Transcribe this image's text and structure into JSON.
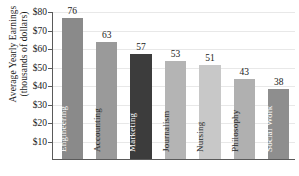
{
  "chart_data": {
    "type": "bar",
    "title": "",
    "xlabel": "",
    "ylabel": "Average Yearly Earnings (thousands of dollars)",
    "ylabel_line1": "Average Yearly Earnings",
    "ylabel_line2": "(thousands of dollars)",
    "categories": [
      "Engineering",
      "Accounting",
      "Marketing",
      "Journalism",
      "Nursing",
      "Philosophy",
      "Social Work"
    ],
    "values": [
      76,
      63,
      57,
      53,
      51,
      43,
      38
    ],
    "bar_colors": [
      "#8a8a8a",
      "#9a9a9a",
      "#3c3c3c",
      "#b4b4b4",
      "#c8c8c8",
      "#b0b0b0",
      "#8e8e8e"
    ],
    "bar_label_colors": [
      "#ffffff",
      "#2a2a2a",
      "#ffffff",
      "#2a2a2a",
      "#2a2a2a",
      "#2a2a2a",
      "#ffffff"
    ],
    "ylim": [
      0,
      80
    ],
    "yticks": [
      10,
      20,
      30,
      40,
      50,
      60,
      70,
      80
    ],
    "ytick_labels": [
      "$10",
      "$20",
      "$30",
      "$40",
      "$50",
      "$60",
      "$70",
      "$80"
    ],
    "grid": true,
    "legend": "none",
    "value_labels": [
      "76",
      "63",
      "57",
      "53",
      "51",
      "43",
      "38"
    ]
  }
}
